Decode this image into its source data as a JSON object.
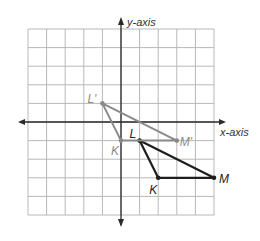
{
  "diagram": {
    "type": "coordinate-plane",
    "grid": {
      "x_range": [
        -5,
        5
      ],
      "y_range": [
        -5,
        5
      ],
      "origin_px": [
        121,
        122
      ],
      "unit_px": 18.6,
      "grid_color": "#b8b8b8",
      "axis_color": "#2a2a2a"
    },
    "axes": {
      "x_label": "x-axis",
      "y_label": "y-axis"
    },
    "triangles": [
      {
        "name": "KLM",
        "color": "#1e1e1e",
        "vertices": [
          {
            "label": "K",
            "x": 2,
            "y": -3,
            "label_dx": -9,
            "label_dy": 16
          },
          {
            "label": "L",
            "x": 1,
            "y": -1,
            "label_dx": -10,
            "label_dy": -3
          },
          {
            "label": "M",
            "x": 5,
            "y": -3,
            "label_dx": 5,
            "label_dy": 5
          }
        ]
      },
      {
        "name": "K'L'M'",
        "color": "#8a8a8a",
        "vertices": [
          {
            "label": "K",
            "x": 0,
            "y": -1,
            "label_dx": -10,
            "label_dy": 14
          },
          {
            "label": "L'",
            "x": -1,
            "y": 1,
            "label_dx": -15,
            "label_dy": 0
          },
          {
            "label": "M'",
            "x": 3,
            "y": -1,
            "label_dx": 3,
            "label_dy": 5
          }
        ]
      }
    ]
  }
}
